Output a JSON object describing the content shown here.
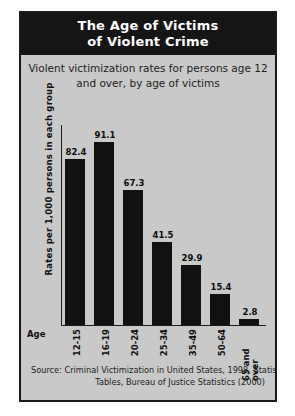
{
  "figure": {
    "title_lines": [
      "The Age of Victims",
      "of Violent Crime"
    ],
    "subtitle_lines": [
      "Violent victimization rates for persons age 12",
      "and over, by age of victims"
    ],
    "axis_group_label": "Age",
    "source_lines": [
      "Source: Criminal Victimization in United States, 1998, Statistical",
      "Tables, Bureau of Justice Statistics (2000)"
    ],
    "colors": {
      "title_bar": "#151515",
      "panel_background": "#c9c9c9",
      "bar_fill": "#111111",
      "border": "#1b1b1b",
      "text": "#1d1d1d",
      "title_text": "#ffffff"
    }
  },
  "chart_data": {
    "type": "bar",
    "title": "The Age of Victims of Violent Crime",
    "subtitle": "Violent victimization rates for persons age 12 and over, by age of victims",
    "xlabel": "Age",
    "ylabel": "Rates per 1,000 persons in each group",
    "categories": [
      "12-15",
      "16-19",
      "20-24",
      "25-34",
      "35-49",
      "50-64",
      "65 and over"
    ],
    "values": [
      82.4,
      91.1,
      67.3,
      41.5,
      29.9,
      15.4,
      2.8
    ],
    "value_labels": [
      "82.4",
      "91.1",
      "67.3",
      "41.5",
      "29.9",
      "15.4",
      "2.8"
    ],
    "ylim": [
      0,
      100
    ],
    "grid": false,
    "legend": false,
    "y_tick_labels": [],
    "source": "Source: Criminal Victimization in United States, 1998, Statistical Tables, Bureau of Justice Statistics (2000)"
  }
}
